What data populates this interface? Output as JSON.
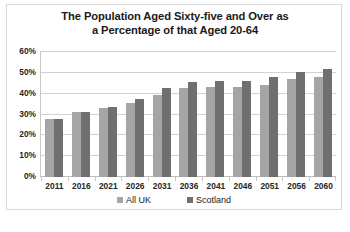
{
  "chart_data": {
    "type": "bar",
    "title": "The Population Aged Sixty-five and Over as a Percentage of that Aged 20-64",
    "title_line1": "The Population Aged Sixty-five and Over as",
    "title_line2": "a Percentage of that Aged 20-64",
    "xlabel": "",
    "ylabel": "",
    "ylim": [
      0,
      60
    ],
    "y_tick_labels": [
      "60%",
      "50%",
      "40%",
      "30%",
      "20%",
      "10%",
      "0%"
    ],
    "y_tick_values": [
      60,
      50,
      40,
      30,
      20,
      10,
      0
    ],
    "grid": true,
    "legend_position": "bottom",
    "categories": [
      "2011",
      "2016",
      "2021",
      "2026",
      "2031",
      "2036",
      "2041",
      "2046",
      "2051",
      "2056",
      "2060"
    ],
    "series": [
      {
        "name": "All UK",
        "color": "#a5a5a5",
        "values": [
          28,
          31,
          33,
          35.5,
          39.5,
          42.5,
          43,
          43,
          44,
          47,
          48
        ]
      },
      {
        "name": "Scotland",
        "color": "#6f6f6f",
        "values": [
          28,
          31,
          33.5,
          37.5,
          42.5,
          45.5,
          46,
          46,
          48,
          50.5,
          52
        ]
      }
    ]
  }
}
